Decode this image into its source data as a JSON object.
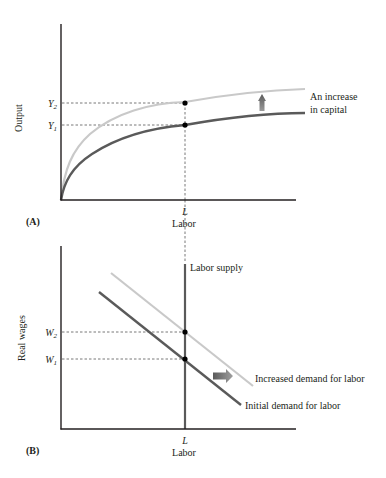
{
  "panel_a": {
    "tag": "(A)",
    "y_axis_label": "Output",
    "x_axis_label": "Labor",
    "x_tick": "L",
    "y_ticks": [
      {
        "main": "Y",
        "sub": "2"
      },
      {
        "main": "Y",
        "sub": "1"
      }
    ],
    "annotation_line1": "An increase",
    "annotation_line2": "in capital",
    "curves": [
      {
        "name": "Production function after increase in capital",
        "color": "#c9c9c9"
      },
      {
        "name": "Initial production function",
        "color": "#5a5a5a"
      }
    ],
    "arrow_direction": "up"
  },
  "panel_b": {
    "tag": "(B)",
    "y_axis_label": "Real wages",
    "x_axis_label": "Labor",
    "x_tick": "L",
    "y_ticks": [
      {
        "main": "W",
        "sub": "2"
      },
      {
        "main": "W",
        "sub": "1"
      }
    ],
    "supply_label": "Labor supply",
    "increased_demand_label": "Increased demand for labor",
    "initial_demand_label": "Initial demand for labor",
    "curves": [
      {
        "name": "Labor supply",
        "color": "#5a5a5a"
      },
      {
        "name": "Increased demand for labor",
        "color": "#c9c9c9"
      },
      {
        "name": "Initial demand for labor",
        "color": "#5a5a5a"
      }
    ],
    "arrow_direction": "right"
  },
  "colors": {
    "axis": "#231f20",
    "dark_curve": "#5a5a5a",
    "light_curve": "#c9c9c9",
    "dashed": "#555555",
    "point": "#000000"
  }
}
